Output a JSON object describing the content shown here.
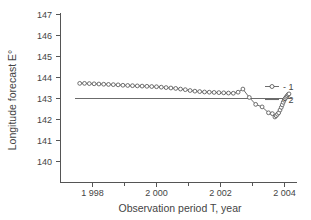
{
  "chart_data": {
    "type": "line",
    "title": "",
    "xlabel": "Observation period T, year",
    "ylabel": "Longitude forecast E°",
    "xlim": [
      1997.3,
      2004.6
    ],
    "ylim": [
      139.55,
      147.0
    ],
    "grid": false,
    "legend_position": "right",
    "xticks": [
      1998,
      2000,
      2002,
      2004
    ],
    "xtick_labels": [
      "1 998",
      "2 000",
      "2 002",
      "2 004"
    ],
    "xminor_ticks": [
      1999,
      2001,
      2003
    ],
    "yticks": [
      140,
      141,
      142,
      143,
      144,
      145,
      146,
      147
    ],
    "ytick_labels": [
      "140",
      "141",
      "142",
      "143",
      "144",
      "145",
      "146",
      "147"
    ],
    "series": [
      {
        "name": "1",
        "legend_label": "- 1",
        "marker": "open-circle",
        "line": true,
        "x": [
          1997.6,
          1997.75,
          1997.9,
          1998.05,
          1998.2,
          1998.35,
          1998.5,
          1998.65,
          1998.8,
          1998.95,
          1999.1,
          1999.25,
          1999.4,
          1999.55,
          1999.7,
          1999.85,
          2000.0,
          2000.15,
          2000.3,
          2000.45,
          2000.6,
          2000.75,
          2000.9,
          2001.05,
          2001.2,
          2001.35,
          2001.5,
          2001.65,
          2001.8,
          2001.95,
          2002.1,
          2002.25,
          2002.4,
          2002.55,
          2002.7,
          2002.9,
          2003.1,
          2003.3,
          2003.5,
          2003.62,
          2003.7,
          2003.74,
          2003.78,
          2003.82,
          2003.86,
          2003.9,
          2003.93,
          2003.96,
          2003.99,
          2004.02,
          2004.05,
          2004.08,
          2004.11,
          2004.14
        ],
        "y": [
          143.72,
          143.72,
          143.71,
          143.7,
          143.69,
          143.68,
          143.67,
          143.66,
          143.65,
          143.63,
          143.62,
          143.61,
          143.6,
          143.59,
          143.58,
          143.57,
          143.56,
          143.54,
          143.52,
          143.5,
          143.48,
          143.45,
          143.42,
          143.38,
          143.35,
          143.33,
          143.31,
          143.3,
          143.29,
          143.28,
          143.27,
          143.26,
          143.25,
          143.3,
          143.45,
          143.05,
          142.72,
          142.6,
          142.32,
          142.28,
          142.12,
          142.18,
          142.25,
          142.32,
          142.45,
          142.58,
          142.7,
          142.82,
          142.92,
          143.0,
          143.06,
          143.12,
          143.18,
          143.22
        ]
      },
      {
        "name": "2",
        "legend_label": "- 2",
        "marker": "none",
        "line": true,
        "constant_y": 143.0,
        "x": [
          1997.45,
          2004.22
        ],
        "y": [
          143.0,
          143.0
        ]
      }
    ]
  },
  "legend": {
    "entries": [
      {
        "label": "- 1",
        "marker": "open-circle"
      },
      {
        "label": "- 2",
        "marker": "line"
      }
    ]
  },
  "axes": {
    "y_axis_title": "Longitude forecast E°",
    "x_axis_title": "Observation period T, year"
  },
  "colors": {
    "series1": "#4d4d4d",
    "series2": "#6b6b6b",
    "axis": "#555555",
    "text": "#444444",
    "background": "#ffffff"
  }
}
